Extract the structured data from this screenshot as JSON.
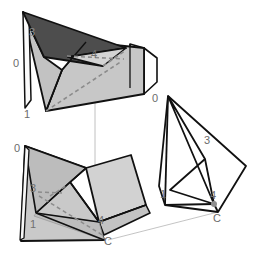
{
  "figure": {
    "colors": {
      "stroke": "#111111",
      "dark_face": "#4d4d4d",
      "mid_face": "#b8b8b8",
      "light_face": "#c9c9c9",
      "lighter_face": "#d8d8d8",
      "white_face": "#ffffff",
      "dashed_crease": "#8a8a8a",
      "thin_guide": "#aaaaaa",
      "label_text": "#6b6b6b",
      "label_text_on_dark": "#8e8e8e"
    },
    "panels": [
      {
        "id": "top-left-folded-form",
        "name": "Top folded form",
        "labels": [
          {
            "text": "3",
            "x": 32,
            "y": 36
          },
          {
            "text": "0",
            "x": 16,
            "y": 67
          },
          {
            "text": "4",
            "x": 94,
            "y": 58
          },
          {
            "text": "1",
            "x": 27,
            "y": 118
          }
        ]
      },
      {
        "id": "bottom-left-folded-form",
        "name": "Bottom folded form",
        "labels": [
          {
            "text": "0",
            "x": 17,
            "y": 152
          },
          {
            "text": "3",
            "x": 33,
            "y": 192
          },
          {
            "text": "1",
            "x": 33,
            "y": 228
          },
          {
            "text": "4",
            "x": 101,
            "y": 224
          },
          {
            "text": "C",
            "x": 108,
            "y": 245
          }
        ]
      },
      {
        "id": "right-wireframe-form",
        "name": "Right wireframe form",
        "labels": [
          {
            "text": "0",
            "x": 155,
            "y": 102
          },
          {
            "text": "3",
            "x": 207,
            "y": 144
          },
          {
            "text": "1",
            "x": 163,
            "y": 198
          },
          {
            "text": "4",
            "x": 214,
            "y": 200
          },
          {
            "text": "C",
            "x": 217,
            "y": 220
          }
        ]
      }
    ]
  }
}
